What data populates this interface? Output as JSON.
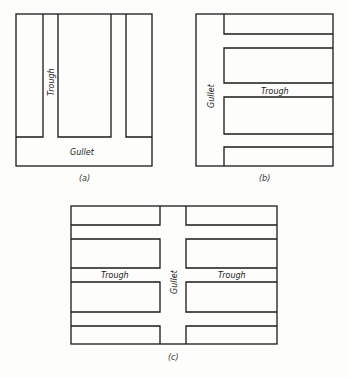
{
  "figure": {
    "panels": [
      {
        "id": "a",
        "caption": "(a)",
        "labels": {
          "trough": "Trough",
          "gullet": "Gullet"
        },
        "description": "Vertical troughs draining downward into a horizontal gullet at the bottom"
      },
      {
        "id": "b",
        "caption": "(b)",
        "labels": {
          "trough": "Trough",
          "gullet": "Gullet"
        },
        "description": "Horizontal troughs draining leftward into a vertical gullet on the left side"
      },
      {
        "id": "c",
        "caption": "(c)",
        "labels": {
          "trough_left": "Trough",
          "trough_right": "Trough",
          "gullet": "Gullet"
        },
        "description": "Horizontal troughs on both sides draining into a central vertical gullet"
      }
    ],
    "colors": {
      "line": "#1a1a1a",
      "background": "#fdfdfb"
    }
  }
}
